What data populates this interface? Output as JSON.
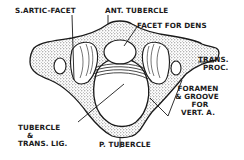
{
  "diagram": {
    "colors": {
      "ink": "#1a1a1a",
      "background": "#ffffff",
      "stipple": "#555555"
    },
    "labels": {
      "s_artic_facet": "S.ARTIC-FACET",
      "ant_tubercle": "ANT. TUBERCLE",
      "facet_for_dens": "FACET FOR DENS",
      "trans_proc_1": "TRANS.",
      "trans_proc_2": "PROC.",
      "foramen_1": "FORAMEN",
      "foramen_2": "& GROOVE",
      "foramen_3": "FOR",
      "foramen_4": "VERT. A.",
      "tubercle_1": "TUBERCLE",
      "tubercle_2": "&",
      "tubercle_3": "TRANS. LIG.",
      "p_tubercle": "P. TUBERCLE"
    }
  }
}
